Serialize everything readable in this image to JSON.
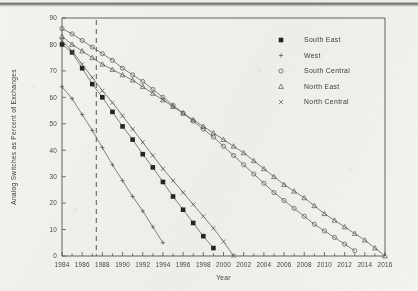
{
  "chart_data": {
    "type": "line",
    "title": "",
    "xlabel": "Year",
    "ylabel": "Analog Switches as Percent of Exchanges",
    "xlim": [
      1984,
      2016
    ],
    "ylim": [
      0,
      90
    ],
    "ytick_step": 10,
    "xtick_step": 1,
    "xtick_label_step": 2,
    "grid": false,
    "legend_position": "upper-right",
    "ytick_labels": [
      "0",
      "10",
      "20",
      "30",
      "40",
      "50",
      "60",
      "70",
      "80",
      "90"
    ],
    "xtick_labels": [
      "1984",
      "1986",
      "1988",
      "1990",
      "1992",
      "1994",
      "1996",
      "1998",
      "2000",
      "2002",
      "2004",
      "2006",
      "2008",
      "2010",
      "2012",
      "2014",
      "2016"
    ],
    "annotations": [
      {
        "name": "forecast-divider",
        "type": "vertical-dashed-line",
        "x": 1987.4
      }
    ],
    "series": [
      {
        "name": "South East",
        "marker": "filled-square",
        "x": [
          1984,
          1985,
          1986,
          1987,
          1988,
          1989,
          1990,
          1991,
          1992,
          1993,
          1994,
          1995,
          1996,
          1997,
          1998,
          1999
        ],
        "values": [
          80,
          77,
          71,
          65,
          60,
          54.5,
          49,
          44,
          38.5,
          33.5,
          28,
          22.5,
          17.5,
          12.5,
          7.5,
          3
        ]
      },
      {
        "name": "West",
        "marker": "plus",
        "x": [
          1984,
          1985,
          1986,
          1987,
          1988,
          1989,
          1990,
          1991,
          1992,
          1993,
          1994
        ],
        "values": [
          64,
          59.5,
          53.5,
          47.5,
          41,
          34.5,
          28.5,
          22.5,
          17,
          11,
          5
        ]
      },
      {
        "name": "South Central",
        "marker": "open-circle",
        "x": [
          1984,
          1985,
          1986,
          1987,
          1988,
          1989,
          1990,
          1991,
          1992,
          1993,
          1994,
          1995,
          1996,
          1997,
          1998,
          1999,
          2000,
          2001,
          2002,
          2003,
          2004,
          2005,
          2006,
          2007,
          2008,
          2009,
          2010,
          2011,
          2012,
          2013
        ],
        "values": [
          86,
          84,
          81.5,
          79,
          76.5,
          74,
          71,
          68.5,
          66,
          63,
          60,
          57,
          54,
          51,
          48,
          45,
          41.5,
          38,
          34.5,
          31,
          27.5,
          24,
          21,
          18,
          15,
          12,
          9.5,
          7,
          4.5,
          2
        ]
      },
      {
        "name": "North East",
        "marker": "open-triangle",
        "x": [
          1984,
          1985,
          1986,
          1987,
          1988,
          1989,
          1990,
          1991,
          1992,
          1993,
          1994,
          1995,
          1996,
          1997,
          1998,
          1999,
          2000,
          2001,
          2002,
          2003,
          2004,
          2005,
          2006,
          2007,
          2008,
          2009,
          2010,
          2011,
          2012,
          2013,
          2014,
          2015,
          2016
        ],
        "values": [
          83,
          80,
          77.5,
          75,
          72.5,
          70.5,
          68.5,
          66.5,
          64,
          61.5,
          59,
          56.5,
          54,
          51.5,
          49,
          46.5,
          44,
          41.5,
          39,
          36,
          33,
          30,
          27,
          24.5,
          22,
          19,
          16,
          13.5,
          11,
          8.5,
          6,
          3,
          0
        ]
      },
      {
        "name": "North Central",
        "marker": "x-cross",
        "x": [
          1984,
          1985,
          1986,
          1987,
          1988,
          1989,
          1990,
          1991,
          1992,
          1993,
          1994,
          1995,
          1996,
          1997,
          1998,
          1999,
          2000,
          2001
        ],
        "values": [
          81.5,
          77.5,
          72.5,
          67.5,
          62.5,
          58,
          53,
          48,
          43,
          38,
          33,
          28.5,
          24,
          19.5,
          15,
          10.5,
          5.5,
          0
        ]
      }
    ]
  },
  "legend": {
    "entries": [
      {
        "label": "South East",
        "marker": "filled-square"
      },
      {
        "label": "West",
        "marker": "plus"
      },
      {
        "label": "South Central",
        "marker": "open-circle"
      },
      {
        "label": "North East",
        "marker": "open-triangle"
      },
      {
        "label": "North Central",
        "marker": "x-cross"
      }
    ]
  }
}
